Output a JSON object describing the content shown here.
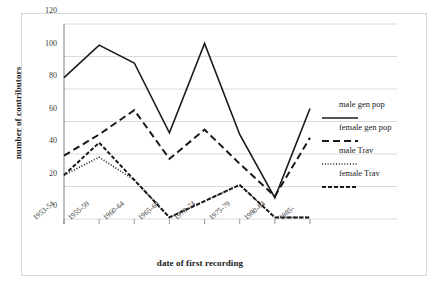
{
  "chart_data": {
    "type": "line",
    "title": "",
    "xlabel": "date of first recording",
    "ylabel": "number of contributors",
    "categories": [
      "1953-54",
      "1955-59",
      "1960-64",
      "1965-69",
      "1970-74",
      "1975-79",
      "1980-84",
      "1985-"
    ],
    "ylim": [
      0,
      120
    ],
    "yticks": [
      0,
      20,
      40,
      60,
      80,
      100,
      120
    ],
    "grid": true,
    "legend_position": "right",
    "series": [
      {
        "name": "male gen pop",
        "style": "solid",
        "values": [
          87,
          107,
          96,
          53,
          108,
          52,
          13,
          68
        ]
      },
      {
        "name": "female gen pop",
        "style": "dashed",
        "values": [
          39,
          52,
          67,
          37,
          55,
          34,
          14,
          50
        ]
      },
      {
        "name": "male Trav",
        "style": "dotted",
        "values": [
          27,
          38,
          24,
          1,
          11,
          21,
          1,
          1
        ]
      },
      {
        "name": "female Trav",
        "style": "dashdot",
        "values": [
          27,
          47,
          24,
          1,
          11,
          21,
          1,
          1
        ]
      }
    ]
  },
  "legend": {
    "items": [
      {
        "label": "male gen pop"
      },
      {
        "label": "female gen pop"
      },
      {
        "label": "male Trav"
      },
      {
        "label": "female Trav"
      }
    ]
  },
  "colors": {
    "line": "#1a1a1a",
    "grid": "#d0d0d0",
    "axis": "#808080",
    "frame": "#d9d9d9",
    "background": "#ffffff"
  }
}
